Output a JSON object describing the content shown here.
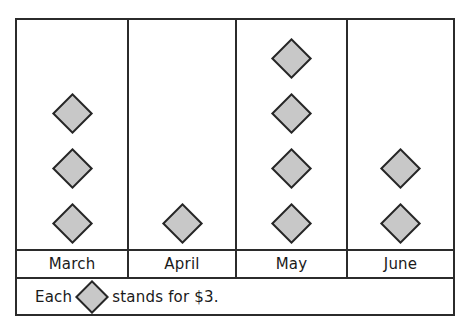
{
  "chart_data": {
    "type": "bar",
    "chart_style": "pictograph",
    "title": "",
    "xlabel": "",
    "ylabel": "",
    "categories": [
      "March",
      "April",
      "May",
      "June"
    ],
    "values": [
      3,
      1,
      4,
      2
    ],
    "symbol_counts": [
      3,
      1,
      4,
      2
    ],
    "symbol": "diamond",
    "symbol_value": 3,
    "unit": "$",
    "dollar_values": [
      9,
      3,
      12,
      6
    ],
    "grid": false,
    "legend_position": "bottom",
    "series": [
      {
        "name": "Amount saved",
        "values": [
          3,
          1,
          4,
          2
        ]
      }
    ],
    "annotations": [
      "Each diamond stands for $3."
    ]
  },
  "colors": {
    "symbol_fill": "#c8c8c8",
    "symbol_stroke": "#262626",
    "border": "#2b2b2b",
    "text": "#1a1a1a",
    "background": "#ffffff"
  },
  "columns": [
    {
      "label": "March",
      "count": 3
    },
    {
      "label": "April",
      "count": 1
    },
    {
      "label": "May",
      "count": 4
    },
    {
      "label": "June",
      "count": 2
    }
  ],
  "legend": {
    "prefix": "Each",
    "symbol_name": "diamond-symbol",
    "suffix": "stands for $3.",
    "full_text": "Each  stands for $3."
  }
}
